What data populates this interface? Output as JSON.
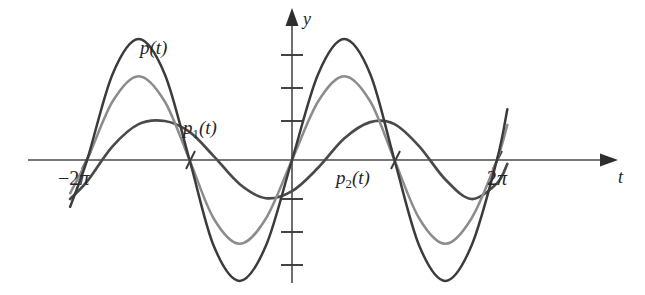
{
  "figure": {
    "background_color": "#ffffff"
  },
  "axes": {
    "x_axis": {
      "label": "t",
      "label_x": 618,
      "label_y": 168,
      "y_pixel": 160,
      "x_start": 28,
      "x_end": 606,
      "arrow": "right"
    },
    "y_axis": {
      "label": "y",
      "label_x": 303,
      "label_y": 10,
      "x_pixel": 292,
      "y_start": 283,
      "y_end": 14,
      "arrow": "up"
    },
    "x_ticks": [
      {
        "x": 86,
        "label": "−2π",
        "label_x": 58,
        "label_y": 168
      },
      {
        "x": 190,
        "label": "",
        "label_x": 0,
        "label_y": 0
      },
      {
        "x": 395,
        "label": "",
        "label_x": 0,
        "label_y": 0
      },
      {
        "x": 497,
        "label": "2π",
        "label_x": 487,
        "label_y": 168
      }
    ],
    "y_ticks": [
      {
        "y": 55
      },
      {
        "y": 88
      },
      {
        "y": 121
      },
      {
        "y": 199
      },
      {
        "y": 232
      },
      {
        "y": 265
      }
    ]
  },
  "curve_labels": [
    {
      "name": "p(t)",
      "base": "p",
      "sub": "",
      "tail": "(t)",
      "x": 140,
      "y": 38
    },
    {
      "name": "p1(t)",
      "base": "p",
      "sub": "1",
      "tail": "(t)",
      "x": 183,
      "y": 118
    },
    {
      "name": "p2(t)",
      "base": "p",
      "sub": "2",
      "tail": "(t)",
      "x": 336,
      "y": 168
    }
  ],
  "chart_data": {
    "type": "line",
    "xlabel": "t",
    "ylabel": "y",
    "xlim": [
      -7.5,
      7.5
    ],
    "ylim": [
      -4.2,
      4.2
    ],
    "grid": false,
    "legend": "inline-annotations",
    "xticks": [
      -6.2832,
      -3.1416,
      3.1416,
      6.2832
    ],
    "xticklabels": [
      "−2π",
      "",
      "",
      "2π"
    ],
    "yticks": [
      -3,
      -2,
      -1,
      1,
      2,
      3
    ],
    "series": [
      {
        "name": "p(t)",
        "color": "#3b3b3b",
        "amplitude": 3.1,
        "description": "largest amplitude wave, peaks near t=-4.7 and t=1.6, troughs near t=-1.6 and t=4.7",
        "x": [
          -6.8,
          -6.28,
          -5.5,
          -4.7,
          -3.9,
          -3.14,
          -2.4,
          -1.6,
          -0.8,
          0,
          0.8,
          1.6,
          2.4,
          3.14,
          3.9,
          4.7,
          5.5,
          6.28,
          6.6
        ],
        "y": [
          -1.2,
          0,
          2.2,
          3.1,
          2.2,
          0,
          -2.2,
          -3.1,
          -2.2,
          0,
          2.2,
          3.1,
          2.2,
          0,
          -2.2,
          -3.1,
          -2.2,
          0,
          1.3
        ]
      },
      {
        "name": "p1(t)",
        "color": "#8c8c8c",
        "amplitude": 2.15,
        "description": "medium amplitude wave, same phase as p(t)",
        "x": [
          -6.8,
          -6.28,
          -5.5,
          -4.7,
          -3.9,
          -3.14,
          -2.4,
          -1.6,
          -0.8,
          0,
          0.8,
          1.6,
          2.4,
          3.14,
          3.9,
          4.7,
          5.5,
          6.28,
          6.6
        ],
        "y": [
          -0.85,
          0,
          1.5,
          2.15,
          1.5,
          0,
          -1.5,
          -2.15,
          -1.5,
          0,
          1.5,
          2.15,
          1.5,
          0,
          -1.5,
          -2.15,
          -1.5,
          0,
          0.9
        ]
      },
      {
        "name": "p2(t)",
        "color": "#4a4a4a",
        "amplitude": 1.0,
        "description": "smallest amplitude flatter wave, shifted phase, peaks near t=-3.6 and t=2.7",
        "x": [
          -6.8,
          -6.28,
          -5.5,
          -4.7,
          -3.9,
          -3.14,
          -2.4,
          -1.6,
          -0.8,
          0,
          0.8,
          1.6,
          2.4,
          3.14,
          3.9,
          4.7,
          5.5,
          6.28,
          6.6
        ],
        "y": [
          -1.0,
          -0.55,
          0.35,
          0.92,
          1.0,
          0.72,
          0.1,
          -0.62,
          -0.98,
          -0.8,
          -0.2,
          0.55,
          0.97,
          0.92,
          0.35,
          -0.5,
          -1.0,
          -0.6,
          -0.1
        ]
      }
    ]
  }
}
